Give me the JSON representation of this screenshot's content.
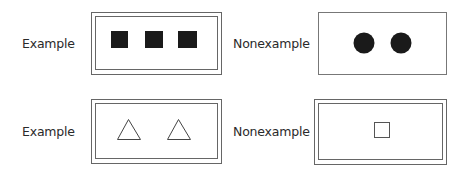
{
  "colors": {
    "stroke": "#555555",
    "fill": "#1a1a1a",
    "background": "#ffffff"
  },
  "panels": [
    {
      "id": "top-left",
      "label": "Example",
      "frame": "double",
      "shapes": "3 filled squares"
    },
    {
      "id": "top-right",
      "label": "Nonexample",
      "frame": "single",
      "shapes": "2 filled circles"
    },
    {
      "id": "bottom-left",
      "label": "Example",
      "frame": "double",
      "shapes": "2 outlined triangles"
    },
    {
      "id": "bottom-right",
      "label": "Nonexample",
      "frame": "double",
      "shapes": "1 outlined square"
    }
  ]
}
